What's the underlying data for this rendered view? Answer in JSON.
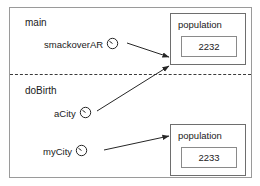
{
  "diagram": {
    "type": "object-reference-diagram",
    "scopes": [
      {
        "name": "scope-main",
        "label": "main"
      },
      {
        "name": "scope-dobirth",
        "label": "doBirth"
      }
    ],
    "divider": {
      "style": "dashed",
      "name": "scope-divider"
    },
    "variables": [
      {
        "name": "smackoverAR",
        "label": "smackoverAR",
        "scope": "main",
        "icon": "reference-circle-icon",
        "points_to": "population-2232"
      },
      {
        "name": "aCity",
        "label": "aCity",
        "scope": "doBirth",
        "icon": "reference-circle-icon",
        "points_to": "population-2232"
      },
      {
        "name": "myCity",
        "label": "myCity",
        "scope": "doBirth",
        "icon": "reference-circle-icon",
        "points_to": "population-2233"
      }
    ],
    "objects": [
      {
        "name": "population-2232",
        "title": "population",
        "field_value": "2232"
      },
      {
        "name": "population-2233",
        "title": "population",
        "field_value": "2233"
      }
    ],
    "arrows": [
      {
        "name": "arrow-smackoverar-to-population-2232",
        "from": "smackoverAR",
        "to": "population-2232"
      },
      {
        "name": "arrow-acity-to-population-2232",
        "from": "aCity",
        "to": "population-2232"
      },
      {
        "name": "arrow-mycity-to-population-2233",
        "from": "myCity",
        "to": "population-2233"
      }
    ],
    "colors": {
      "frame_border": "#9a9a9a",
      "box_border": "#6e6e6e",
      "inner_box_border": "#8a8a8a",
      "text": "#1a1a1a",
      "arrow": "#262626",
      "divider": "#3a3a3a",
      "background": "#ffffff"
    }
  }
}
